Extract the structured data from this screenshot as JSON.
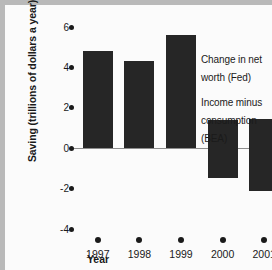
{
  "chart_data": {
    "type": "bar",
    "title": "",
    "xlabel": "Year",
    "ylabel": "Saving (trillions of dollars a year)",
    "categories": [
      "1997",
      "1998",
      "1999",
      "2000",
      "2001"
    ],
    "ylim": [
      -4,
      6
    ],
    "yticks": [
      "6",
      "4",
      "2",
      "0",
      "-2",
      "-4"
    ],
    "ytick_values": [
      6,
      4,
      2,
      0,
      -2,
      -4
    ],
    "grid": false,
    "legend_position": "inside-right",
    "series": [
      {
        "name": "Change in net worth (Fed)",
        "values": [
          4.8,
          4.3,
          5.6,
          -1.5,
          -2.1
        ]
      },
      {
        "name": "Income minus consumption (BEA)",
        "values": [
          1.4,
          1.4,
          1.4,
          1.4,
          1.45
        ]
      }
    ],
    "bars": [
      {
        "year": "1997",
        "top": 4.8,
        "bottom": 0.0
      },
      {
        "year": "1998",
        "top": 4.3,
        "bottom": 0.0
      },
      {
        "year": "1999",
        "top": 5.6,
        "bottom": 0.0
      },
      {
        "year": "2000",
        "top": 1.4,
        "bottom": -1.5
      },
      {
        "year": "2001",
        "top": 1.45,
        "bottom": -2.1
      }
    ],
    "colors": {
      "bar": "#262626",
      "background": "#fbfbfb",
      "axis_text": "#1a1a1a",
      "zero_line": "#8d8d8d",
      "border": "#b9b9b9"
    }
  },
  "legend": {
    "items": [
      {
        "label": "Change in net worth (Fed)"
      },
      {
        "label": "Income minus consumption (BEA)"
      }
    ]
  }
}
